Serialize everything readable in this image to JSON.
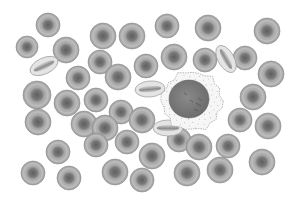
{
  "image": {
    "description": "Illustration of blood cells: many grey red blood cells (erythrocytes) surrounding a single white blood cell (leukocyte) with speckled cytoplasm and a large dark nucleus",
    "width": 298,
    "height": 204,
    "background": "#ffffff"
  },
  "colors": {
    "rbc_rim": "#b4b4b4",
    "rbc_mid": "#a0a0a0",
    "rbc_center": "#6e6e6e",
    "rbc_outline": "#8c8c8c",
    "wbc_cytoplasm": "#f6f6f6",
    "wbc_outline": "#9a9a9a",
    "wbc_nucleus": "#777777",
    "wbc_dots": "#8a8a8a"
  },
  "wbc": {
    "cx": 192,
    "cy": 101,
    "rx": 30,
    "ry": 29,
    "nucleus_rx": 20,
    "nucleus_ry": 19
  },
  "rbc_round": [
    [
      48,
      25,
      12
    ],
    [
      103,
      36,
      13
    ],
    [
      132,
      36,
      13
    ],
    [
      167,
      26,
      12
    ],
    [
      208,
      28,
      13
    ],
    [
      267,
      31,
      13
    ],
    [
      27,
      47,
      11
    ],
    [
      66,
      50,
      13
    ],
    [
      174,
      57,
      13
    ],
    [
      245,
      58,
      12
    ],
    [
      271,
      74,
      13
    ],
    [
      40,
      66,
      0
    ],
    [
      100,
      62,
      12
    ],
    [
      118,
      77,
      13
    ],
    [
      146,
      66,
      12
    ],
    [
      205,
      60,
      12
    ],
    [
      37,
      95,
      14
    ],
    [
      78,
      78,
      12
    ],
    [
      67,
      103,
      13
    ],
    [
      96,
      100,
      12
    ],
    [
      121,
      112,
      12
    ],
    [
      142,
      120,
      13
    ],
    [
      253,
      97,
      13
    ],
    [
      38,
      122,
      13
    ],
    [
      84,
      124,
      13
    ],
    [
      105,
      128,
      13
    ],
    [
      240,
      120,
      12
    ],
    [
      268,
      126,
      13
    ],
    [
      58,
      152,
      12
    ],
    [
      96,
      145,
      12
    ],
    [
      127,
      142,
      12
    ],
    [
      152,
      156,
      13
    ],
    [
      179,
      140,
      12
    ],
    [
      199,
      147,
      13
    ],
    [
      228,
      146,
      12
    ],
    [
      262,
      162,
      13
    ],
    [
      33,
      173,
      12
    ],
    [
      69,
      178,
      12
    ],
    [
      115,
      172,
      13
    ],
    [
      142,
      180,
      12
    ],
    [
      187,
      173,
      13
    ],
    [
      220,
      170,
      13
    ],
    [
      131,
      165,
      0
    ]
  ],
  "rbc_side": [
    [
      44,
      66,
      15,
      8,
      -25
    ],
    [
      150,
      89,
      15,
      8,
      -5
    ],
    [
      226,
      59,
      15,
      8,
      60
    ],
    [
      168,
      128,
      15,
      8,
      0
    ],
    [
      83,
      56,
      0,
      0,
      0
    ]
  ]
}
